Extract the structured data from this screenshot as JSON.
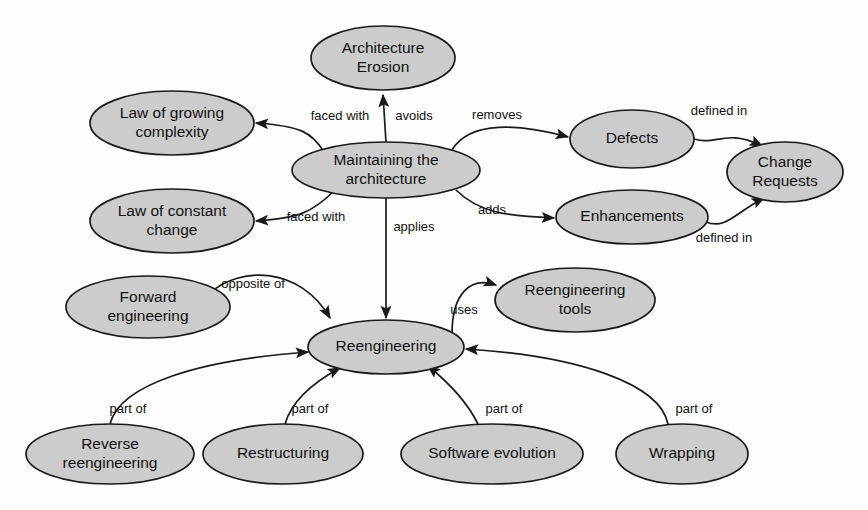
{
  "diagram": {
    "type": "concept-map",
    "background_color": "#fdfdfd",
    "node_fill_color": "#cccccc",
    "node_stroke_color": "#1a1a1a",
    "text_color": "#111111"
  },
  "nodes": [
    {
      "id": "architecture-erosion",
      "label_lines": [
        "Architecture",
        "Erosion"
      ],
      "cx": 383,
      "cy": 58,
      "rx": 72,
      "ry": 32
    },
    {
      "id": "law-growing-complexity",
      "label_lines": [
        "Law of growing",
        "complexity"
      ],
      "cx": 172,
      "cy": 123,
      "rx": 82,
      "ry": 32
    },
    {
      "id": "maintaining-architecture",
      "label_lines": [
        "Maintaining the",
        "architecture"
      ],
      "cx": 386,
      "cy": 170,
      "rx": 94,
      "ry": 28
    },
    {
      "id": "law-constant-change",
      "label_lines": [
        "Law of constant",
        "change"
      ],
      "cx": 172,
      "cy": 221,
      "rx": 82,
      "ry": 32
    },
    {
      "id": "defects",
      "label_lines": [
        "Defects"
      ],
      "cx": 632,
      "cy": 139,
      "rx": 62,
      "ry": 29
    },
    {
      "id": "change-requests",
      "label_lines": [
        "Change",
        "Requests"
      ],
      "cx": 785,
      "cy": 172,
      "rx": 58,
      "ry": 30
    },
    {
      "id": "enhancements",
      "label_lines": [
        "Enhancements"
      ],
      "cx": 632,
      "cy": 217,
      "rx": 76,
      "ry": 27
    },
    {
      "id": "forward-engineering",
      "label_lines": [
        "Forward",
        "engineering"
      ],
      "cx": 148,
      "cy": 307,
      "rx": 82,
      "ry": 31
    },
    {
      "id": "reengineering-tools",
      "label_lines": [
        "Reengineering",
        "tools"
      ],
      "cx": 575,
      "cy": 300,
      "rx": 80,
      "ry": 32
    },
    {
      "id": "reengineering",
      "label_lines": [
        "Reengineering"
      ],
      "cx": 386,
      "cy": 347,
      "rx": 78,
      "ry": 27
    },
    {
      "id": "reverse-reengineering",
      "label_lines": [
        "Reverse",
        "reengineering"
      ],
      "cx": 110,
      "cy": 454,
      "rx": 84,
      "ry": 30
    },
    {
      "id": "restructuring",
      "label_lines": [
        "Restructuring"
      ],
      "cx": 283,
      "cy": 454,
      "rx": 80,
      "ry": 30
    },
    {
      "id": "software-evolution",
      "label_lines": [
        "Software evolution"
      ],
      "cx": 492,
      "cy": 454,
      "rx": 91,
      "ry": 30
    },
    {
      "id": "wrapping",
      "label_lines": [
        "Wrapping"
      ],
      "cx": 682,
      "cy": 454,
      "rx": 66,
      "ry": 30
    }
  ],
  "edges": [
    {
      "id": "maintaining-avoids-erosion",
      "from": "maintaining-architecture",
      "to": "architecture-erosion",
      "label": "avoids",
      "path": "M 386 142 L 383 95",
      "label_x": 414,
      "label_y": 117
    },
    {
      "id": "maintaining-facedwith-growing",
      "from": "maintaining-architecture",
      "to": "law-growing-complexity",
      "label": "faced with",
      "path": "M 324 152 C 312 132 300 126 256 123",
      "label_x": 340,
      "label_y": 117
    },
    {
      "id": "maintaining-facedwith-constant",
      "from": "maintaining-architecture",
      "to": "law-constant-change",
      "label": "faced with",
      "path": "M 333 192 C 312 212 300 218 256 221",
      "label_x": 316,
      "label_y": 218
    },
    {
      "id": "maintaining-removes-defects",
      "from": "maintaining-architecture",
      "to": "defects",
      "label": "removes",
      "path": "M 452 150 C 470 120 520 124 568 137",
      "label_x": 497,
      "label_y": 116
    },
    {
      "id": "maintaining-adds-enhancements",
      "from": "maintaining-architecture",
      "to": "enhancements",
      "label": "adds",
      "path": "M 456 190 C 480 214 510 216 554 218",
      "label_x": 492,
      "label_y": 211
    },
    {
      "id": "defects-definedin-change-requests",
      "from": "defects",
      "to": "change-requests",
      "label": "defined in",
      "path": "M 694 139 C 716 146 726 128 762 146",
      "label_x": 719,
      "label_y": 112
    },
    {
      "id": "enhancements-definedin-change-requests",
      "from": "enhancements",
      "to": "change-requests",
      "label": "defined in",
      "path": "M 706 222 C 726 230 736 212 764 198",
      "label_x": 724,
      "label_y": 239
    },
    {
      "id": "maintaining-applies-reengineering",
      "from": "maintaining-architecture",
      "to": "reengineering",
      "label": "applies",
      "path": "M 386 198 L 386 318",
      "label_x": 414,
      "label_y": 228
    },
    {
      "id": "forward-oppositeof-reengineering",
      "from": "forward-engineering",
      "to": "reengineering",
      "label": "opposite of",
      "path": "M 210 293 C 240 266 300 266 330 318",
      "label_x": 253,
      "label_y": 285
    },
    {
      "id": "reengineering-uses-tools",
      "from": "reengineering",
      "to": "reengineering-tools",
      "label": "uses",
      "path": "M 452 334 C 452 294 470 276 496 285",
      "label_x": 464,
      "label_y": 311
    },
    {
      "id": "reverse-partof-reengineering",
      "from": "reverse-reengineering",
      "to": "reengineering",
      "label": "part of",
      "path": "M 110 424 C 120 384 200 360 308 352",
      "label_x": 128,
      "label_y": 410
    },
    {
      "id": "restructuring-partof-reengineering",
      "from": "restructuring",
      "to": "reengineering",
      "label": "part of",
      "path": "M 285 424 C 292 400 314 382 340 368",
      "label_x": 310,
      "label_y": 410
    },
    {
      "id": "software-evolution-partof-reengineering",
      "from": "software-evolution",
      "to": "reengineering",
      "label": "part of",
      "path": "M 478 424 C 466 400 448 382 428 366",
      "label_x": 504,
      "label_y": 410
    },
    {
      "id": "wrapping-partof-reengineering",
      "from": "wrapping",
      "to": "reengineering",
      "label": "part of",
      "path": "M 668 424 C 660 384 580 356 466 349",
      "label_x": 694,
      "label_y": 410
    }
  ]
}
